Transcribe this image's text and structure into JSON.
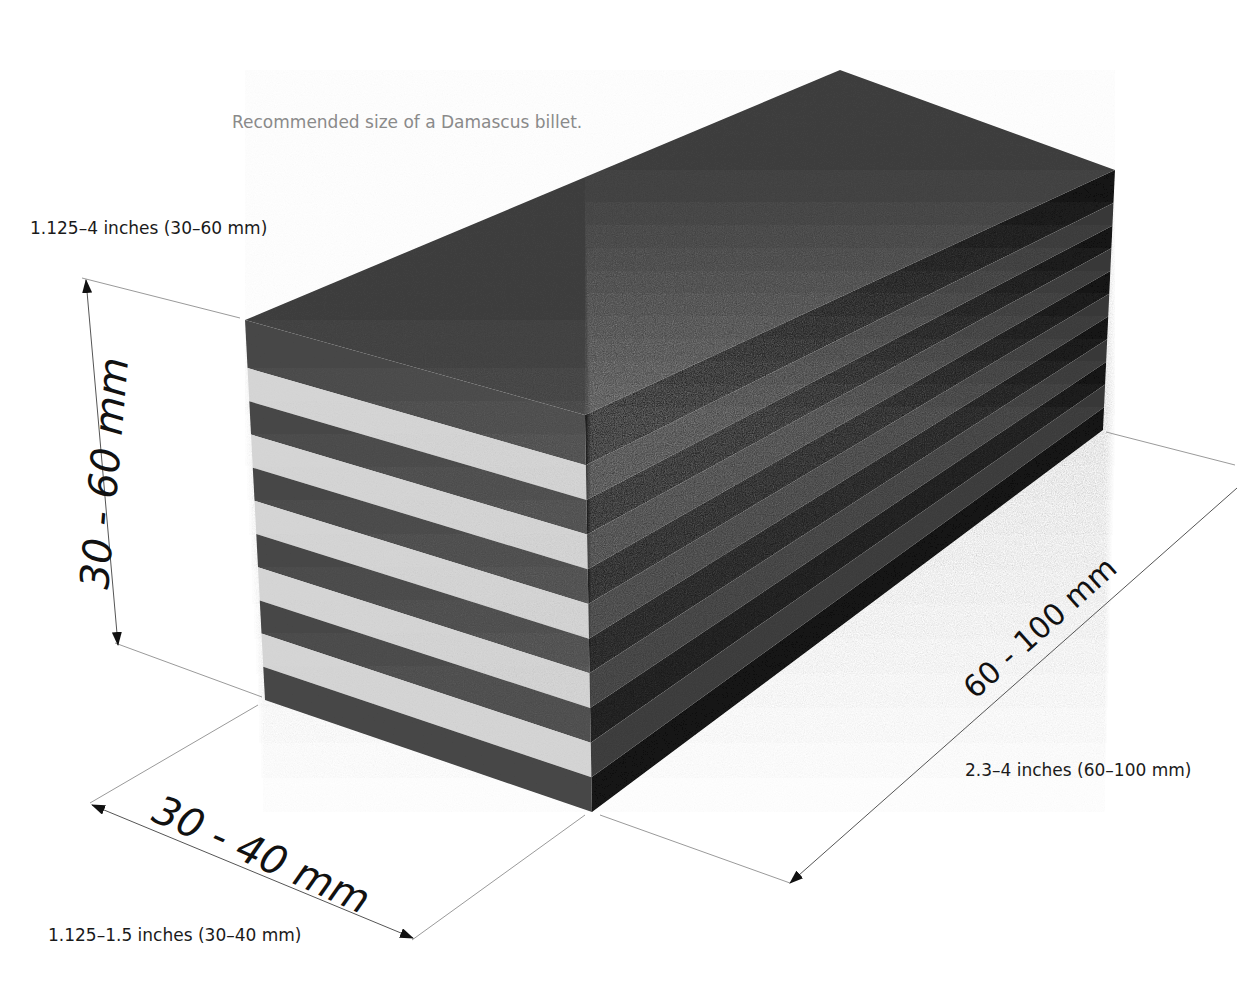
{
  "figure": {
    "title": "Recommended size of a Damascus billet.",
    "colors": {
      "background": "#ffffff",
      "top_face": "#3f3f3f",
      "front_dark": "#474747",
      "front_light": "#d6d6d6",
      "side_dark": "#121212",
      "side_mid": "#383838",
      "dim_line": "#9a9a9a",
      "text": "#1a1a1a",
      "title_text": "#8a8a8a"
    },
    "dimensions": {
      "height": {
        "metric_label": "30 - 60 mm",
        "imperial_label": "1.125–4 inches (30–60 mm)"
      },
      "width": {
        "metric_label": "30 - 40 mm",
        "imperial_label": "1.125–1.5 inches (30–40 mm)"
      },
      "length": {
        "metric_label": "60 - 100 mm",
        "imperial_label": "2.3–4 inches (60–100 mm)"
      }
    },
    "layers": {
      "front_stripe_count": 11,
      "pattern": [
        "dark",
        "light",
        "dark",
        "light",
        "dark",
        "light",
        "dark",
        "light",
        "dark",
        "light",
        "dark"
      ]
    }
  }
}
